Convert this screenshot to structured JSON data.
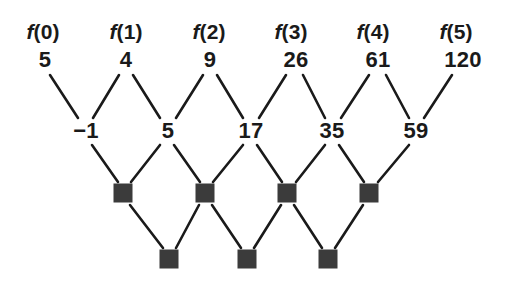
{
  "figure": {
    "background_color": "#ffffff",
    "ink_color": "#1a1a1a",
    "blank_box_color": "#3b3b3b"
  },
  "rows": {
    "function_labels": [
      {
        "name": "f-label-0",
        "text": "f(0)",
        "italic_part": "f",
        "rest": "(0)",
        "x": 43,
        "y": 31
      },
      {
        "name": "f-label-1",
        "text": "f(1)",
        "italic_part": "f",
        "rest": "(1)",
        "x": 126,
        "y": 31
      },
      {
        "name": "f-label-2",
        "text": "f(2)",
        "italic_part": "f",
        "rest": "(2)",
        "x": 209,
        "y": 31
      },
      {
        "name": "f-label-3",
        "text": "f(3)",
        "italic_part": "f",
        "rest": "(3)",
        "x": 291,
        "y": 31
      },
      {
        "name": "f-label-4",
        "text": "f(4)",
        "italic_part": "f",
        "rest": "(4)",
        "x": 373,
        "y": 31
      },
      {
        "name": "f-label-5",
        "text": "f(5)",
        "italic_part": "f",
        "rest": "(5)",
        "x": 456,
        "y": 31
      }
    ],
    "values_row_0": [
      {
        "text": "5",
        "x": 45,
        "y": 60
      },
      {
        "text": "4",
        "x": 126,
        "y": 60
      },
      {
        "text": "9",
        "x": 210,
        "y": 60
      },
      {
        "text": "26",
        "x": 296,
        "y": 60
      },
      {
        "text": "61",
        "x": 378,
        "y": 60
      },
      {
        "text": "120",
        "x": 463,
        "y": 60
      }
    ],
    "values_row_1": [
      {
        "text": "−1",
        "x": 86,
        "y": 131
      },
      {
        "text": "5",
        "x": 168,
        "y": 131
      },
      {
        "text": "17",
        "x": 251,
        "y": 131
      },
      {
        "text": "35",
        "x": 332,
        "y": 131
      },
      {
        "text": "59",
        "x": 416,
        "y": 131
      }
    ],
    "blanks_row_2": [
      {
        "text": "",
        "x": 123,
        "y": 193
      },
      {
        "text": "",
        "x": 205,
        "y": 193
      },
      {
        "text": "",
        "x": 287,
        "y": 193
      },
      {
        "text": "",
        "x": 369,
        "y": 193
      }
    ],
    "blanks_row_3": [
      {
        "text": "",
        "x": 169,
        "y": 259
      },
      {
        "text": "",
        "x": 247,
        "y": 259
      },
      {
        "text": "",
        "x": 328,
        "y": 259
      }
    ]
  },
  "edges": [
    {
      "from": "row0-0",
      "to": "row1-0",
      "x1": 50,
      "y1": 75,
      "x2": 78,
      "y2": 118
    },
    {
      "from": "row0-1",
      "to": "row1-0",
      "x1": 119,
      "y1": 75,
      "x2": 93,
      "y2": 118
    },
    {
      "from": "row0-1",
      "to": "row1-1",
      "x1": 133,
      "y1": 75,
      "x2": 160,
      "y2": 118
    },
    {
      "from": "row0-2",
      "to": "row1-1",
      "x1": 203,
      "y1": 75,
      "x2": 176,
      "y2": 118
    },
    {
      "from": "row0-2",
      "to": "row1-2",
      "x1": 217,
      "y1": 75,
      "x2": 243,
      "y2": 118
    },
    {
      "from": "row0-3",
      "to": "row1-2",
      "x1": 286,
      "y1": 75,
      "x2": 259,
      "y2": 118
    },
    {
      "from": "row0-3",
      "to": "row1-3",
      "x1": 303,
      "y1": 75,
      "x2": 325,
      "y2": 118
    },
    {
      "from": "row0-4",
      "to": "row1-3",
      "x1": 369,
      "y1": 75,
      "x2": 341,
      "y2": 118
    },
    {
      "from": "row0-4",
      "to": "row1-4",
      "x1": 386,
      "y1": 75,
      "x2": 409,
      "y2": 118
    },
    {
      "from": "row0-5",
      "to": "row1-4",
      "x1": 452,
      "y1": 75,
      "x2": 424,
      "y2": 118
    },
    {
      "from": "row1-0",
      "to": "row2-0",
      "x1": 92,
      "y1": 145,
      "x2": 118,
      "y2": 182
    },
    {
      "from": "row1-1",
      "to": "row2-0",
      "x1": 160,
      "y1": 145,
      "x2": 131,
      "y2": 182
    },
    {
      "from": "row1-1",
      "to": "row2-1",
      "x1": 174,
      "y1": 145,
      "x2": 200,
      "y2": 182
    },
    {
      "from": "row1-2",
      "to": "row2-1",
      "x1": 243,
      "y1": 145,
      "x2": 213,
      "y2": 182
    },
    {
      "from": "row1-2",
      "to": "row2-2",
      "x1": 257,
      "y1": 145,
      "x2": 282,
      "y2": 182
    },
    {
      "from": "row1-3",
      "to": "row2-2",
      "x1": 325,
      "y1": 145,
      "x2": 296,
      "y2": 182
    },
    {
      "from": "row1-3",
      "to": "row2-3",
      "x1": 339,
      "y1": 145,
      "x2": 364,
      "y2": 182
    },
    {
      "from": "row1-4",
      "to": "row2-3",
      "x1": 409,
      "y1": 145,
      "x2": 378,
      "y2": 182
    },
    {
      "from": "row2-0",
      "to": "row3-0",
      "x1": 130,
      "y1": 205,
      "x2": 163,
      "y2": 248
    },
    {
      "from": "row2-1",
      "to": "row3-0",
      "x1": 199,
      "y1": 205,
      "x2": 176,
      "y2": 248
    },
    {
      "from": "row2-1",
      "to": "row3-1",
      "x1": 212,
      "y1": 205,
      "x2": 241,
      "y2": 248
    },
    {
      "from": "row2-2",
      "to": "row3-1",
      "x1": 281,
      "y1": 205,
      "x2": 254,
      "y2": 248
    },
    {
      "from": "row2-2",
      "to": "row3-2",
      "x1": 294,
      "y1": 205,
      "x2": 322,
      "y2": 248
    },
    {
      "from": "row2-3",
      "to": "row3-2",
      "x1": 363,
      "y1": 205,
      "x2": 335,
      "y2": 248
    }
  ]
}
